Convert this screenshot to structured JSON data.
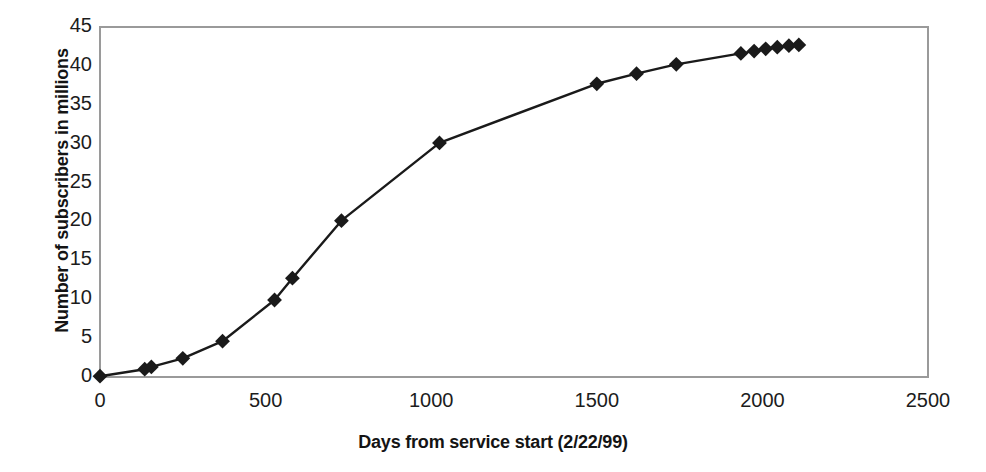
{
  "chart_data": {
    "type": "line",
    "title": "",
    "subtitle": "",
    "xlabel": "Days from service start (2/22/99)",
    "ylabel": "Number of subscribers in millions",
    "xlim": [
      0,
      2500
    ],
    "ylim": [
      0,
      45
    ],
    "xticks": [
      0,
      500,
      1000,
      1500,
      2000,
      2500
    ],
    "yticks": [
      0,
      5,
      10,
      15,
      20,
      25,
      30,
      35,
      40,
      45
    ],
    "xtick_labels": [
      "0",
      "500",
      "1000",
      "1500",
      "2000",
      "2500"
    ],
    "ytick_labels": [
      "0",
      "5",
      "10",
      "15",
      "20",
      "25",
      "30",
      "35",
      "40",
      "45"
    ],
    "grid": false,
    "legend": null,
    "legend_position": "none",
    "marker": "diamond",
    "marker_color": "#1a1a1a",
    "line_color": "#1a1a1a",
    "plot_border_color": "#9a9a9a",
    "background_color": "#ffffff",
    "series": [
      {
        "name": "Subscribers",
        "x": [
          0,
          135,
          155,
          250,
          370,
          527,
          581,
          729,
          1025,
          1500,
          1620,
          1740,
          1935,
          1975,
          2010,
          2045,
          2080,
          2110
        ],
        "y": [
          0.1,
          1.0,
          1.3,
          2.4,
          4.6,
          9.9,
          12.7,
          20.1,
          30.1,
          37.7,
          39.0,
          40.2,
          41.6,
          41.9,
          42.2,
          42.4,
          42.6,
          42.7
        ]
      }
    ],
    "annotations": []
  }
}
